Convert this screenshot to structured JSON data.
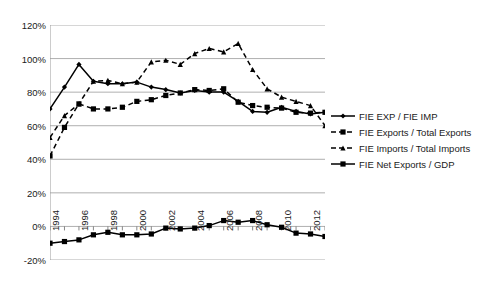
{
  "chart_data": {
    "type": "line",
    "title": "",
    "xlabel": "",
    "ylabel": "",
    "ylim": [
      -20,
      120
    ],
    "ytick_values": [
      120,
      100,
      80,
      60,
      40,
      20,
      0,
      -20
    ],
    "ytick_labels": [
      "120%",
      "100%",
      "80%",
      "60%",
      "40%",
      "20%",
      "0%",
      "-20%"
    ],
    "grid": "horizontal",
    "legend_position": "right",
    "x": [
      1994,
      1995,
      1996,
      1997,
      1998,
      1999,
      2000,
      2001,
      2002,
      2003,
      2004,
      2005,
      2006,
      2007,
      2008,
      2009,
      2010,
      2011,
      2012,
      2013
    ],
    "xtick_labels": [
      "1994",
      "1996",
      "1998",
      "2000",
      "2002",
      "2004",
      "2006",
      "2008",
      "2010",
      "2012"
    ],
    "xtick_years": [
      1994,
      1996,
      1998,
      2000,
      2002,
      2004,
      2006,
      2008,
      2010,
      2012
    ],
    "series": [
      {
        "name": "FIE EXP / FIE IMP",
        "style": "solid",
        "marker": "diamond",
        "values": [
          70,
          83,
          96.5,
          86.5,
          85,
          85,
          86,
          83,
          81.5,
          79.5,
          81,
          80,
          80,
          74.5,
          68.5,
          68,
          71,
          68.5,
          67,
          68
        ]
      },
      {
        "name": "FIE Exports / Total Exports",
        "style": "dashed",
        "marker": "square",
        "values": [
          42,
          59,
          73,
          70,
          70,
          71,
          74.5,
          75.5,
          78,
          79.5,
          81.5,
          81,
          82,
          74,
          72,
          71,
          70.5,
          68,
          67.5,
          68
        ]
      },
      {
        "name": "FIE Imports / Total Imports",
        "style": "dashed",
        "marker": "triangle",
        "values": [
          53,
          66,
          73,
          86.5,
          87,
          85,
          86,
          98,
          99,
          96.5,
          103,
          106,
          104,
          109,
          93.5,
          82,
          77,
          74.5,
          72,
          60
        ]
      },
      {
        "name": "FIE Net Exports / GDP",
        "style": "solid",
        "marker": "square",
        "values": [
          -10,
          -9,
          -8,
          -5,
          -3.5,
          -5,
          -5,
          -4.5,
          -1,
          -1.5,
          -1,
          0.5,
          3.5,
          2.5,
          3.5,
          1,
          -0.5,
          -4,
          -4.5,
          -6
        ]
      }
    ]
  },
  "legend": {
    "items": [
      {
        "label": "FIE EXP / FIE IMP"
      },
      {
        "label": "FIE Exports / Total Exports"
      },
      {
        "label": "FIE Imports / Total Imports"
      },
      {
        "label": "FIE Net Exports / GDP"
      }
    ]
  }
}
